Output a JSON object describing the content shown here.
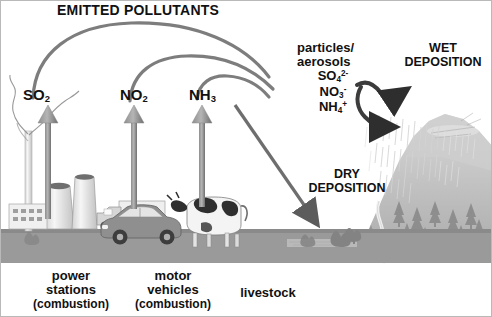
{
  "title": "EMITTED POLLUTANTS",
  "pollutants": [
    {
      "id": "so2",
      "formula": "SO",
      "sub": "2",
      "sup": "",
      "x": 22,
      "y": 88
    },
    {
      "id": "no2",
      "formula": "NO",
      "sub": "2",
      "sup": "",
      "x": 119,
      "y": 88
    },
    {
      "id": "nh3",
      "formula": "NH",
      "sub": "3",
      "sup": "",
      "x": 188,
      "y": 88
    }
  ],
  "aerosol_block": {
    "line1": "particles/",
    "line2": "aerosols",
    "ions": [
      {
        "base": "SO",
        "sub": "4",
        "sup": "2-"
      },
      {
        "base": "NO",
        "sub": "3",
        "sup": "-"
      },
      {
        "base": "NH",
        "sub": "4",
        "sup": "+"
      }
    ]
  },
  "deposition": {
    "wet_line1": "WET",
    "wet_line2": "DEPOSITION",
    "dry_line1": "DRY",
    "dry_line2": "DEPOSITION"
  },
  "sources": [
    {
      "id": "power",
      "line1": "power",
      "line2": "stations",
      "line3": "(combustion)",
      "cx": 70
    },
    {
      "id": "motor",
      "line1": "motor",
      "line2": "vehicles",
      "line3": "(combustion)",
      "cx": 172
    },
    {
      "id": "livestock",
      "line1": "livestock",
      "line2": "",
      "line3": "",
      "cx": 252
    }
  ],
  "colors": {
    "text": "#111111",
    "arrow_gray": "#7d7d7d",
    "arrow_dark": "#3c3c3c",
    "ground": "#9a9a9a",
    "hill": "#bdbdbd",
    "tree": "#8e8e8e",
    "sky": "#ffffff",
    "tower": "#ededed",
    "tower_edge": "#9b9b9b"
  }
}
